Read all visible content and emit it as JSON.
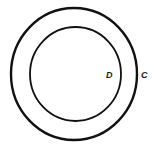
{
  "diagram": {
    "background": "#ffffff",
    "stroke_color": "#111111",
    "outer_circle": {
      "label": "C",
      "cx": 74,
      "cy": 74,
      "rx": 63,
      "ry": 66,
      "stroke_width": 2.4
    },
    "inner_circle": {
      "label": "D",
      "cx": 75.5,
      "cy": 74,
      "rx": 45.5,
      "ry": 47,
      "stroke_width": 1.8
    }
  }
}
